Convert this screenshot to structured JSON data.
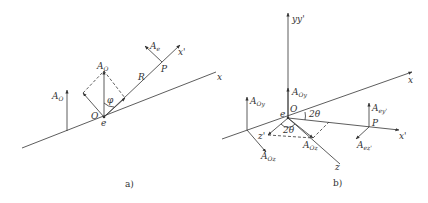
{
  "panel_a": {
    "caption": "a)",
    "labels": {
      "A_O_left": {
        "main": "A",
        "sub": "O"
      },
      "A_O_center": {
        "main": "A",
        "sub": "O"
      },
      "phi": "φ",
      "O": "O",
      "e": "e",
      "R": "R",
      "P": "P",
      "A_e": {
        "main": "A",
        "sub": "e"
      },
      "x_prime": "x'",
      "x": "x"
    }
  },
  "panel_b": {
    "caption": "b)",
    "labels": {
      "yy_prime": "yy'",
      "x": "x",
      "x_prime": "x'",
      "z": "z",
      "z_prime": "z'",
      "O": "O",
      "e": "e",
      "two_theta_right": "2θ",
      "two_theta_bottom": "2θ",
      "A_Oy_center": {
        "main": "A",
        "sub": "Oy"
      },
      "A_Oy_left": {
        "main": "A",
        "sub": "Oy"
      },
      "A_Oz_left": {
        "main": "A",
        "sub": "Oz"
      },
      "A_Oz_center": {
        "main": "A",
        "sub": "Oz"
      },
      "P": "P",
      "A_ey_prime": {
        "main": "A",
        "sub": "ey'"
      },
      "A_ez_prime": {
        "main": "A",
        "sub": "ez'"
      }
    }
  },
  "colors": {
    "stroke": "#333333",
    "background": "#ffffff"
  }
}
